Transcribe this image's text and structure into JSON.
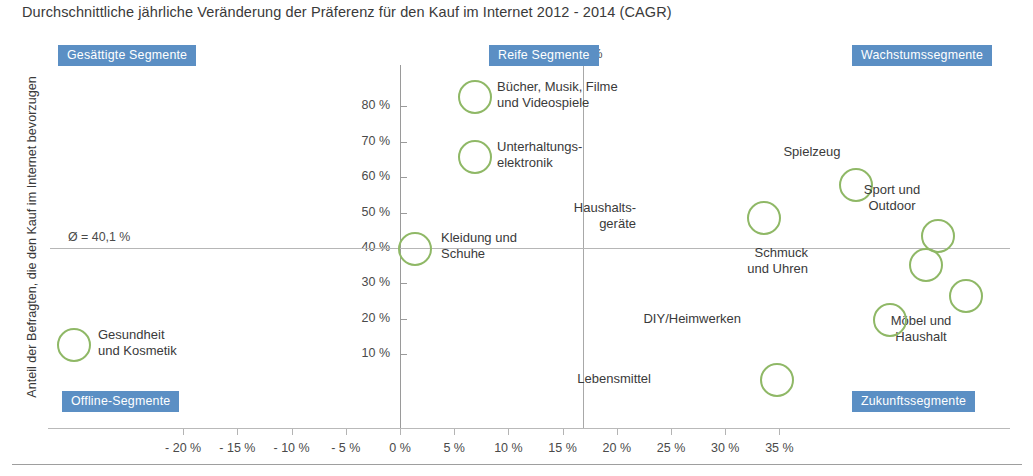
{
  "title": "Durchschnittliche jährliche Veränderung der Präferenz für den Kauf im Internet 2012 - 2014 (CAGR)",
  "axes": {
    "y_title": "Anteil der Befragten, die den Kauf im Internet bevorzugen",
    "x_title": "",
    "x_ticks": [
      "- 20 %",
      "- 15 %",
      "- 10 %",
      "- 5 %",
      "0 %",
      "5 %",
      "10 %",
      "15 %",
      "20 %",
      "25 %",
      "30 %",
      "35 %"
    ],
    "y_ticks": [
      "80 %",
      "70 %",
      "60 %",
      "50 %",
      "40 %",
      "30 %",
      "20 %",
      "10 %"
    ]
  },
  "mean_lines": {
    "x_label": "Ø = 16,9 %",
    "y_label": "Ø = 40,1 %",
    "x_value": 16.9,
    "y_value": 40.1
  },
  "quadrants": [
    {
      "key": "top_left",
      "label": "Gesättigte Segmente"
    },
    {
      "key": "top_right_inner",
      "label": "Reife Segmente"
    },
    {
      "key": "top_right",
      "label": "Wachstumssegmente"
    },
    {
      "key": "bottom_left",
      "label": "Offline-Segmente"
    },
    {
      "key": "bottom_right",
      "label": "Zukunftssegmente"
    }
  ],
  "colors": {
    "bubble_stroke": "#8fb866",
    "badge_background": "#5b8fc4",
    "badge_text": "#ffffff",
    "axis": "#9a9a9a",
    "text": "#3a3a3a"
  },
  "chart_data": {
    "type": "scatter",
    "title": "Durchschnittliche jährliche Veränderung der Präferenz für den Kauf im Internet 2012 - 2014 (CAGR)",
    "xlabel": "Durchschnittliche jährliche Veränderung (CAGR)",
    "ylabel": "Anteil der Befragten, die den Kauf im Internet bevorzugen",
    "xlim": [
      -20,
      35
    ],
    "ylim": [
      5,
      85
    ],
    "x_unit": "%",
    "y_unit": "%",
    "grid": false,
    "legend": "none",
    "marker": "open-circle",
    "reference_lines": [
      {
        "orientation": "vertical",
        "value": 16.9,
        "label": "Ø = 16,9 %"
      },
      {
        "orientation": "horizontal",
        "value": 40.1,
        "label": "Ø = 40,1 %"
      }
    ],
    "points": [
      {
        "name": "Bücher, Musik, Filme und Videospiele",
        "x": 3.8,
        "y": 75.0,
        "size": 32,
        "label_pos": "right"
      },
      {
        "name": "Unterhaltungselektronik",
        "x": 3.8,
        "y": 60.0,
        "size": 32,
        "label_pos": "right"
      },
      {
        "name": "Kleidung und Schuhe",
        "x": 1.2,
        "y": 40.0,
        "size": 32,
        "label_pos": "right"
      },
      {
        "name": "Haushaltsgeräte",
        "x": 20.3,
        "y": 47.0,
        "size": 32,
        "label_pos": "left"
      },
      {
        "name": "Spielzeug",
        "x": 26.8,
        "y": 55.5,
        "size": 32,
        "label_pos": "top"
      },
      {
        "name": "Sport und Outdoor",
        "x": 31.1,
        "y": 43.5,
        "size": 32,
        "label_pos": "top"
      },
      {
        "name": "Schmuck und Uhren",
        "x": 30.4,
        "y": 37.5,
        "size": 32,
        "label_pos": "left"
      },
      {
        "name": "Möbel und Haushalt",
        "x": 33.3,
        "y": 30.0,
        "size": 32,
        "label_pos": "bottom"
      },
      {
        "name": "DIY/Heimwerken",
        "x": 29.0,
        "y": 26.5,
        "size": 32,
        "label_pos": "left"
      },
      {
        "name": "Lebensmittel",
        "x": 22.3,
        "y": 11.0,
        "size": 32,
        "label_pos": "left"
      },
      {
        "name": "Gesundheit und Kosmetik",
        "x": -18.3,
        "y": 21.5,
        "size": 32,
        "label_pos": "right"
      }
    ]
  },
  "bubbles": [
    {
      "name": "buecher-musik-filme",
      "label": "Bücher, Musik, Filme\nund Videospiele",
      "cx": 475,
      "cy": 97,
      "r": 17,
      "lx": 497,
      "ly": 79,
      "align": "lt"
    },
    {
      "name": "unterhaltungselektronik",
      "label": "Unterhaltungs-\nelektronik",
      "cx": 475,
      "cy": 157,
      "r": 17,
      "lx": 497,
      "ly": 139,
      "align": "lt"
    },
    {
      "name": "kleidung-und-schuhe",
      "label": "Kleidung und\nSchuhe",
      "cx": 415,
      "cy": 249,
      "r": 17,
      "lx": 441,
      "ly": 230,
      "align": "lt"
    },
    {
      "name": "haushaltsgeraete",
      "label": "Haushalts-\ngeräte",
      "cx": 764,
      "cy": 218,
      "r": 17,
      "lx": 636,
      "ly": 200,
      "align": "rt"
    },
    {
      "name": "spielzeug",
      "label": "Spielzeug",
      "cx": 856,
      "cy": 185,
      "r": 17,
      "lx": 812,
      "ly": 144,
      "align": "ct"
    },
    {
      "name": "sport-und-outdoor",
      "label": "Sport und\nOutdoor",
      "cx": 938,
      "cy": 236,
      "r": 17,
      "lx": 892,
      "ly": 182,
      "align": "ct"
    },
    {
      "name": "schmuck-und-uhren",
      "label": "Schmuck\nund Uhren",
      "cx": 926,
      "cy": 265,
      "r": 17,
      "lx": 808,
      "ly": 245,
      "align": "rt"
    },
    {
      "name": "moebel-und-haushalt",
      "label": "Möbel und\nHaushalt",
      "cx": 966,
      "cy": 296,
      "r": 17,
      "lx": 921,
      "ly": 313,
      "align": "ct"
    },
    {
      "name": "diy-heimwerken",
      "label": "DIY/Heimwerken",
      "cx": 890,
      "cy": 320,
      "r": 17,
      "lx": 741,
      "ly": 311,
      "align": "rt"
    },
    {
      "name": "lebensmittel",
      "label": "Lebensmittel",
      "cx": 777,
      "cy": 380,
      "r": 17,
      "lx": 651,
      "ly": 371,
      "align": "rt"
    },
    {
      "name": "gesundheit-und-kosmetik",
      "label": "Gesundheit\nund Kosmetik",
      "cx": 74,
      "cy": 345,
      "r": 17,
      "lx": 98,
      "ly": 327,
      "align": "lt"
    }
  ]
}
